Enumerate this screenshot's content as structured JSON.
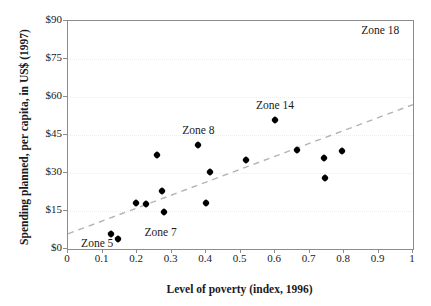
{
  "chart_data": {
    "type": "scatter",
    "title": "",
    "xlabel": "Level of poverty (index, 1996)",
    "ylabel": "Spending planned, per capita, in US$ (1997)",
    "xlim": [
      0,
      1
    ],
    "ylim": [
      0,
      90
    ],
    "xticks": [
      "0",
      "0.1",
      "0.2",
      "0.3",
      "0.4",
      "0.5",
      "0.6",
      "0.7",
      "0.8",
      "0.9",
      "1"
    ],
    "xtick_values": [
      0,
      0.1,
      0.2,
      0.3,
      0.4,
      0.5,
      0.6,
      0.7,
      0.8,
      0.9,
      1
    ],
    "yticks": [
      "$0",
      "$15",
      "$30",
      "$45",
      "$60",
      "$75",
      "$90"
    ],
    "ytick_values": [
      0,
      15,
      30,
      45,
      60,
      75,
      90
    ],
    "grid": "horizontal-faint",
    "legend": "none",
    "marker_color": "#000000",
    "frame_color": "#8c8c8c",
    "trendline": {
      "style": "dashed",
      "color": "#b3b3b3",
      "x0": 0.0,
      "y0": 6.0,
      "x1": 1.0,
      "y1": 57.0
    },
    "points": [
      {
        "x": 0.125,
        "y": 6.0,
        "label": "Zone 5"
      },
      {
        "x": 0.146,
        "y": 4.0,
        "label": ""
      },
      {
        "x": 0.198,
        "y": 18.0,
        "label": ""
      },
      {
        "x": 0.226,
        "y": 17.8,
        "label": ""
      },
      {
        "x": 0.258,
        "y": 37.0,
        "label": ""
      },
      {
        "x": 0.272,
        "y": 23.0,
        "label": ""
      },
      {
        "x": 0.278,
        "y": 14.5,
        "label": ""
      },
      {
        "x": 0.378,
        "y": 41.0,
        "label": "Zone 8"
      },
      {
        "x": 0.4,
        "y": 18.0,
        "label": ""
      },
      {
        "x": 0.413,
        "y": 30.5,
        "label": ""
      },
      {
        "x": 0.516,
        "y": 35.0,
        "label": ""
      },
      {
        "x": 0.6,
        "y": 51.0,
        "label": "Zone 14"
      },
      {
        "x": 0.665,
        "y": 39.0,
        "label": ""
      },
      {
        "x": 0.742,
        "y": 36.0,
        "label": ""
      },
      {
        "x": 0.745,
        "y": 28.0,
        "label": ""
      },
      {
        "x": 0.793,
        "y": 38.5,
        "label": ""
      }
    ],
    "annotations": [
      {
        "text": "Zone 18",
        "x": 0.905,
        "y": 86.0,
        "anchor": "middle",
        "kind": "corner-note"
      },
      {
        "text": "Zone 14",
        "x": 0.6,
        "y": 56.5,
        "anchor": "middle",
        "kind": "point-label"
      },
      {
        "text": "Zone 8",
        "x": 0.378,
        "y": 46.5,
        "anchor": "middle",
        "kind": "point-label"
      },
      {
        "text": "Zone 7",
        "x": 0.222,
        "y": 6.5,
        "anchor": "start",
        "kind": "point-label"
      },
      {
        "text": "Zone 5",
        "x": 0.038,
        "y": 2.0,
        "anchor": "start",
        "kind": "point-label"
      }
    ]
  }
}
